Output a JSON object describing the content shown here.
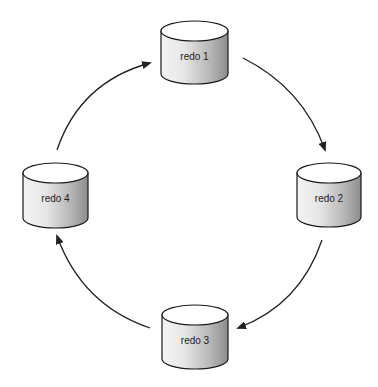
{
  "diagram": {
    "type": "cyclic-flow",
    "nodes": [
      {
        "id": "redo1",
        "label": "redo 1",
        "shape": "cylinder",
        "x": 161,
        "y": 21,
        "w": 67,
        "h": 63
      },
      {
        "id": "redo2",
        "label": "redo 2",
        "shape": "cylinder",
        "x": 297,
        "y": 163,
        "w": 64,
        "h": 64
      },
      {
        "id": "redo3",
        "label": "redo 3",
        "shape": "cylinder",
        "x": 162,
        "y": 305,
        "w": 66,
        "h": 64
      },
      {
        "id": "redo4",
        "label": "redo 4",
        "shape": "cylinder",
        "x": 23,
        "y": 163,
        "w": 65,
        "h": 65
      }
    ],
    "edges": [
      {
        "from": "redo1",
        "to": "redo2"
      },
      {
        "from": "redo2",
        "to": "redo3"
      },
      {
        "from": "redo3",
        "to": "redo4"
      },
      {
        "from": "redo4",
        "to": "redo1"
      }
    ],
    "colors": {
      "stroke": "#1a1a1a",
      "fill_light": "#ffffff",
      "fill_dark": "#8a8a8a",
      "arrow": "#222222"
    }
  }
}
